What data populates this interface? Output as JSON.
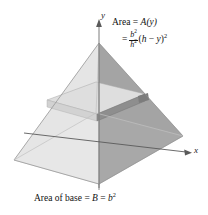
{
  "figure": {
    "name": "pyramid-cross-section-diagram",
    "background_color": "#ffffff"
  },
  "axes": {
    "y_label": "y",
    "x_label": "x",
    "axis_color": "#4a4a4a"
  },
  "annotations": {
    "area_label": "Area = ",
    "area_function": "A(y)",
    "equals": "=",
    "numerator": "b",
    "numerator_exp": "2",
    "denominator": "h",
    "denominator_exp": "2",
    "tail_open": "(",
    "tail_h": "h",
    "tail_minus": " − ",
    "tail_y": "y",
    "tail_close": ")",
    "tail_exp": "2",
    "base_caption_prefix": "Area of base = ",
    "base_caption_B": "B",
    "base_caption_eq": " = ",
    "base_caption_b": "b",
    "base_caption_exp": "2"
  },
  "solid": {
    "shape": "square-pyramid",
    "faces": {
      "front_left_color": "#e3e3e3",
      "front_right_color": "#9f9f9f",
      "back_left_color": "#c9c9c9",
      "back_right_color": "#b4b4b4",
      "base_color": "#efefef",
      "slab_top_color": "#dcdcdc",
      "slab_side_color": "#bdbdbd",
      "slab_dark_color": "#8a8a8a",
      "outline_color": "#8c8c8c"
    },
    "apex": {
      "x": 99,
      "y": 43
    },
    "base_corners": {
      "left": {
        "x": 14,
        "y": 160
      },
      "front": {
        "x": 99,
        "y": 184
      },
      "right": {
        "x": 183,
        "y": 136
      },
      "back": {
        "x": 96,
        "y": 113
      }
    },
    "cross_section": {
      "label": "cross-sectional-slab",
      "height_y": 108
    }
  }
}
